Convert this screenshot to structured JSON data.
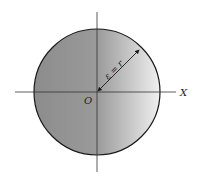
{
  "diagram": {
    "type": "circle-with-axes",
    "origin_label": "O",
    "x_axis_label": "X",
    "radius_label": "ε = r",
    "colors": {
      "fill_dark": "#8a8a8a",
      "fill_light": "#f2f2f2",
      "outline": "#1a1a1a",
      "axis": "#333333"
    }
  }
}
